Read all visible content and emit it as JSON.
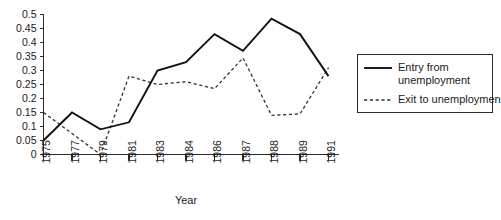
{
  "chart_data": {
    "type": "line",
    "title": "",
    "xlabel": "Year",
    "ylabel": "",
    "categories": [
      "1975",
      "1977",
      "1979",
      "1981",
      "1983",
      "1984",
      "1986",
      "1987",
      "1988",
      "1989",
      "1991"
    ],
    "ylim": [
      0,
      0.5
    ],
    "ytick_labels": [
      "0",
      "0.05",
      "0.1",
      "0.15",
      "0.2",
      "0.25",
      "0.3",
      "0.35",
      "0.4",
      "0.45",
      "0.5"
    ],
    "ytick_values": [
      0,
      0.05,
      0.1,
      0.15,
      0.2,
      0.25,
      0.3,
      0.35,
      0.4,
      0.45,
      0.5
    ],
    "grid": false,
    "legend_position": "right",
    "series": [
      {
        "name": "Entry from unemployment",
        "style": "solid",
        "color": "#111111",
        "values": [
          0.05,
          0.15,
          0.09,
          0.115,
          0.3,
          0.33,
          0.43,
          0.37,
          0.485,
          0.43,
          0.28
        ]
      },
      {
        "name": "Exit to unemployment",
        "style": "dashed",
        "color": "#333333",
        "values": [
          0.15,
          0.075,
          0.0,
          0.28,
          0.25,
          0.26,
          0.235,
          0.345,
          0.14,
          0.145,
          0.31
        ]
      }
    ]
  },
  "legend": {
    "entries": [
      {
        "label_line1": "Entry from",
        "label_line2": "unemployment",
        "style": "solid"
      },
      {
        "label_line1": "Exit to unemployment",
        "label_line2": "",
        "style": "dashed"
      }
    ]
  },
  "axes": {
    "x_title": "Year"
  }
}
